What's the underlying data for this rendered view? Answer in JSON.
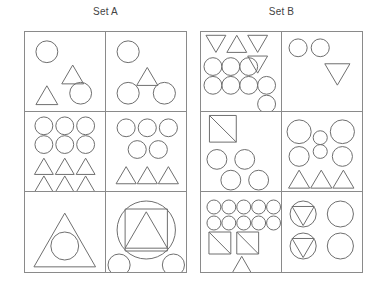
{
  "figure": {
    "type": "shape-comparison-panels",
    "background_color": "#ffffff",
    "stroke_color": "#6f6f6f",
    "border_color": "#8a8a8a",
    "text_color": "#444444"
  },
  "sets": [
    {
      "id": "set-a",
      "title": "Set A",
      "cells": [
        {
          "id": "a1",
          "position": "top-left",
          "shapes": [
            {
              "kind": "circle",
              "cx": 22,
              "cy": 20,
              "r": 11
            },
            {
              "kind": "triangle-up",
              "cx": 48,
              "cy": 43,
              "size": 22
            },
            {
              "kind": "triangle-up",
              "cx": 22,
              "cy": 64,
              "size": 22
            },
            {
              "kind": "circle",
              "cx": 56,
              "cy": 62,
              "r": 11
            }
          ]
        },
        {
          "id": "a2",
          "position": "top-right",
          "shapes": [
            {
              "kind": "circle",
              "cx": 22,
              "cy": 20,
              "r": 11
            },
            {
              "kind": "triangle-up",
              "cx": 41,
              "cy": 45,
              "size": 21
            },
            {
              "kind": "circle",
              "cx": 22,
              "cy": 62,
              "r": 11
            },
            {
              "kind": "circle",
              "cx": 58,
              "cy": 62,
              "r": 11
            }
          ]
        },
        {
          "id": "a3",
          "position": "middle-left",
          "shapes": [
            {
              "kind": "circle",
              "cx": 19,
              "cy": 14,
              "r": 9
            },
            {
              "kind": "circle",
              "cx": 40,
              "cy": 14,
              "r": 9
            },
            {
              "kind": "circle",
              "cx": 61,
              "cy": 14,
              "r": 9
            },
            {
              "kind": "circle",
              "cx": 19,
              "cy": 33,
              "r": 9
            },
            {
              "kind": "circle",
              "cx": 40,
              "cy": 33,
              "r": 9
            },
            {
              "kind": "circle",
              "cx": 61,
              "cy": 33,
              "r": 9
            },
            {
              "kind": "triangle-up",
              "cx": 19,
              "cy": 55,
              "size": 19
            },
            {
              "kind": "triangle-up",
              "cx": 40,
              "cy": 55,
              "size": 19
            },
            {
              "kind": "triangle-up",
              "cx": 61,
              "cy": 55,
              "size": 19
            },
            {
              "kind": "triangle-up",
              "cx": 19,
              "cy": 73,
              "size": 19
            },
            {
              "kind": "triangle-up",
              "cx": 40,
              "cy": 73,
              "size": 19
            },
            {
              "kind": "triangle-up",
              "cx": 61,
              "cy": 73,
              "size": 19
            }
          ]
        },
        {
          "id": "a4",
          "position": "middle-right",
          "shapes": [
            {
              "kind": "circle",
              "cx": 20,
              "cy": 16,
              "r": 9
            },
            {
              "kind": "circle",
              "cx": 41,
              "cy": 16,
              "r": 9
            },
            {
              "kind": "circle",
              "cx": 62,
              "cy": 16,
              "r": 9
            },
            {
              "kind": "circle",
              "cx": 31,
              "cy": 38,
              "r": 9
            },
            {
              "kind": "circle",
              "cx": 52,
              "cy": 38,
              "r": 9
            },
            {
              "kind": "triangle-up",
              "cx": 20,
              "cy": 64,
              "size": 20
            },
            {
              "kind": "triangle-up",
              "cx": 41,
              "cy": 64,
              "size": 20
            },
            {
              "kind": "triangle-up",
              "cx": 62,
              "cy": 64,
              "size": 20
            }
          ]
        },
        {
          "id": "a5",
          "position": "bottom-left",
          "shapes": [
            {
              "kind": "triangle-up",
              "cx": 40,
              "cy": 48,
              "size": 62
            },
            {
              "kind": "circle",
              "cx": 40,
              "cy": 54,
              "r": 14
            }
          ]
        },
        {
          "id": "a6",
          "position": "bottom-right",
          "shapes": [
            {
              "kind": "circle",
              "cx": 40,
              "cy": 38,
              "r": 29
            },
            {
              "kind": "square",
              "cx": 40,
              "cy": 38,
              "size": 42
            },
            {
              "kind": "triangle-up",
              "cx": 40,
              "cy": 38,
              "size": 42
            },
            {
              "kind": "circle",
              "cx": 13,
              "cy": 73,
              "r": 11
            },
            {
              "kind": "circle",
              "cx": 67,
              "cy": 73,
              "r": 11
            }
          ]
        }
      ]
    },
    {
      "id": "set-b",
      "title": "Set B",
      "cells": [
        {
          "id": "b1",
          "position": "top-left",
          "shapes": [
            {
              "kind": "triangle-down",
              "cx": 15,
              "cy": 12,
              "size": 20
            },
            {
              "kind": "triangle-up",
              "cx": 36,
              "cy": 12,
              "size": 20
            },
            {
              "kind": "triangle-down",
              "cx": 57,
              "cy": 12,
              "size": 20
            },
            {
              "kind": "triangle-down",
              "cx": 57,
              "cy": 33,
              "size": 20
            },
            {
              "kind": "circle",
              "cx": 12,
              "cy": 35,
              "r": 9
            },
            {
              "kind": "circle",
              "cx": 30,
              "cy": 35,
              "r": 9
            },
            {
              "kind": "circle",
              "cx": 48,
              "cy": 35,
              "r": 9
            },
            {
              "kind": "circle",
              "cx": 12,
              "cy": 54,
              "r": 9
            },
            {
              "kind": "circle",
              "cx": 30,
              "cy": 54,
              "r": 9
            },
            {
              "kind": "circle",
              "cx": 48,
              "cy": 54,
              "r": 9
            },
            {
              "kind": "circle",
              "cx": 66,
              "cy": 54,
              "r": 9
            },
            {
              "kind": "circle",
              "cx": 66,
              "cy": 73,
              "r": 9
            }
          ]
        },
        {
          "id": "b2",
          "position": "top-right",
          "shapes": [
            {
              "kind": "circle",
              "cx": 16,
              "cy": 16,
              "r": 9
            },
            {
              "kind": "circle",
              "cx": 38,
              "cy": 16,
              "r": 9
            },
            {
              "kind": "triangle-down",
              "cx": 55,
              "cy": 43,
              "size": 25
            }
          ]
        },
        {
          "id": "b3",
          "position": "middle-left",
          "shapes": [
            {
              "kind": "square-diagonal",
              "cx": 22,
              "cy": 17,
              "size": 27
            },
            {
              "kind": "circle",
              "cx": 16,
              "cy": 48,
              "r": 10
            },
            {
              "kind": "circle",
              "cx": 44,
              "cy": 48,
              "r": 10
            },
            {
              "kind": "circle",
              "cx": 30,
              "cy": 69,
              "r": 10
            },
            {
              "kind": "circle",
              "cx": 58,
              "cy": 69,
              "r": 10
            }
          ]
        },
        {
          "id": "b4",
          "position": "middle-right",
          "shapes": [
            {
              "kind": "circle",
              "cx": 17,
              "cy": 20,
              "r": 12
            },
            {
              "kind": "circle",
              "cx": 38,
              "cy": 26,
              "r": 7
            },
            {
              "kind": "circle",
              "cx": 60,
              "cy": 20,
              "r": 12
            },
            {
              "kind": "circle",
              "cx": 17,
              "cy": 45,
              "r": 10
            },
            {
              "kind": "circle",
              "cx": 38,
              "cy": 40,
              "r": 7
            },
            {
              "kind": "circle",
              "cx": 60,
              "cy": 45,
              "r": 10
            },
            {
              "kind": "triangle-up",
              "cx": 17,
              "cy": 68,
              "size": 21
            },
            {
              "kind": "triangle-up",
              "cx": 39,
              "cy": 68,
              "size": 21
            },
            {
              "kind": "triangle-up",
              "cx": 61,
              "cy": 68,
              "size": 21
            }
          ]
        },
        {
          "id": "b5",
          "position": "bottom-left",
          "shapes": [
            {
              "kind": "circle",
              "cx": 13,
              "cy": 15,
              "r": 7
            },
            {
              "kind": "circle",
              "cx": 28,
              "cy": 15,
              "r": 7
            },
            {
              "kind": "circle",
              "cx": 43,
              "cy": 15,
              "r": 7
            },
            {
              "kind": "circle",
              "cx": 58,
              "cy": 15,
              "r": 7
            },
            {
              "kind": "circle",
              "cx": 73,
              "cy": 15,
              "r": 7
            },
            {
              "kind": "circle",
              "cx": 13,
              "cy": 31,
              "r": 7
            },
            {
              "kind": "circle",
              "cx": 28,
              "cy": 31,
              "r": 7
            },
            {
              "kind": "circle",
              "cx": 43,
              "cy": 31,
              "r": 7
            },
            {
              "kind": "circle",
              "cx": 58,
              "cy": 31,
              "r": 7
            },
            {
              "kind": "circle",
              "cx": 73,
              "cy": 31,
              "r": 7
            },
            {
              "kind": "square-diagonal",
              "cx": 19,
              "cy": 51,
              "size": 22
            },
            {
              "kind": "square-diagonal",
              "cx": 47,
              "cy": 51,
              "size": 22
            },
            {
              "kind": "triangle-up",
              "cx": 41,
              "cy": 73,
              "size": 20
            }
          ]
        },
        {
          "id": "b6",
          "position": "bottom-right",
          "shapes": [
            {
              "kind": "circle",
              "cx": 21,
              "cy": 22,
              "r": 13
            },
            {
              "kind": "triangle-down",
              "cx": 21,
              "cy": 24,
              "size": 22
            },
            {
              "kind": "circle",
              "cx": 58,
              "cy": 22,
              "r": 13
            },
            {
              "kind": "circle",
              "cx": 21,
              "cy": 54,
              "r": 13
            },
            {
              "kind": "triangle-down",
              "cx": 21,
              "cy": 56,
              "size": 22
            },
            {
              "kind": "circle",
              "cx": 58,
              "cy": 54,
              "r": 13
            }
          ]
        }
      ]
    }
  ]
}
